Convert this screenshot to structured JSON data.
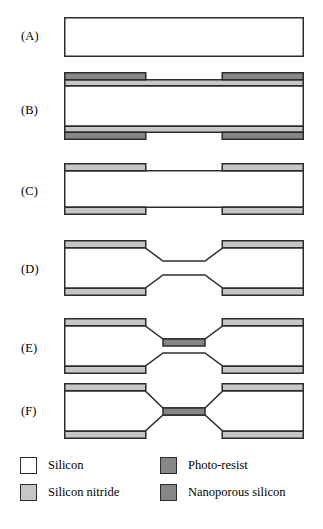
{
  "figure": {
    "panels": [
      {
        "id": "A",
        "label": "(A)",
        "caption": "Bare silicon wafer"
      },
      {
        "id": "B",
        "label": "(B)",
        "caption": "Silicon nitride coating with patterned photo-resist on both sides"
      },
      {
        "id": "C",
        "label": "(C)",
        "caption": "Patterned silicon nitride after photo-resist removal"
      },
      {
        "id": "D",
        "label": "(D)",
        "caption": "Anisotropically etched silicon with tapered sidewalls"
      },
      {
        "id": "E",
        "label": "(E)",
        "caption": "Nanoporous silicon layer formed on thinned membrane"
      },
      {
        "id": "F",
        "label": "(F)",
        "caption": "Released freestanding nanoporous silicon membrane"
      }
    ]
  },
  "legend": {
    "entries": [
      {
        "key": "silicon",
        "label": "Silicon",
        "color": "#ffffff",
        "column": "left",
        "row": 0
      },
      {
        "key": "silicon-nitride",
        "label": "Silicon nitride",
        "color": "#c6c6c6",
        "column": "left",
        "row": 1
      },
      {
        "key": "photo-resist",
        "label": "Photo-resist",
        "color": "#868686",
        "column": "right",
        "row": 0
      },
      {
        "key": "nanoporous-silicon",
        "label": "Nanoporous silicon",
        "color": "#868686",
        "column": "right",
        "row": 1
      }
    ]
  },
  "materials": {
    "silicon": "#ffffff",
    "silicon_nitride": "#c6c6c6",
    "photo_resist": "#868686",
    "nanoporous_silicon": "#868686",
    "outline": "#2b2b2b"
  }
}
